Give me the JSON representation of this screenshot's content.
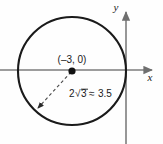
{
  "figure": {
    "type": "geometry-diagram",
    "background_color": "#fefefe",
    "stroke_color": "#1a1a1a",
    "axis_color": "#7d7d7d"
  },
  "axes": {
    "x_label": "x",
    "y_label": "y",
    "x_axis": {
      "y_position": 70,
      "x_start": 0,
      "x_end": 155
    },
    "y_axis": {
      "x_position": 126,
      "y_start": 10,
      "y_end": 144
    }
  },
  "circle": {
    "center_x_px": 72,
    "center_y_px": 71,
    "radius_px": 54,
    "center_label": "(–3, 0)",
    "center_coords": {
      "x": -3,
      "y": 0
    }
  },
  "radius_annotation": {
    "label_prefix": "2",
    "radical_value": "3",
    "approx_symbol": "≈",
    "approx_value": "3.5",
    "full_label": "2√3 ≈ 3.5",
    "arrow_from": {
      "x": 72,
      "y": 71
    },
    "arrow_to": {
      "x": 36,
      "y": 110
    }
  }
}
